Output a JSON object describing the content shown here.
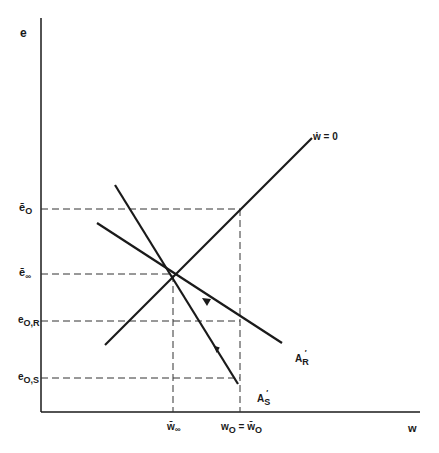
{
  "diagram": {
    "axes": {
      "y_label": "e",
      "x_label": "w"
    },
    "y_ticks": [
      {
        "id": "e_bar_0",
        "base": "ē",
        "sub": "O",
        "y": 209
      },
      {
        "id": "e_bar_inf",
        "base": "ē",
        "sub": "∞",
        "y": 274
      },
      {
        "id": "e_0R",
        "base": "e",
        "sub": "O,R",
        "y": 321
      },
      {
        "id": "e_0S",
        "base": "e",
        "sub": "O,S",
        "y": 378
      }
    ],
    "x_ticks": [
      {
        "id": "w_bar_inf",
        "text": "w̄",
        "sub": "∞",
        "x": 173
      },
      {
        "id": "w_0",
        "text_left": "w",
        "sub_left": "O",
        "eq": " = ",
        "text_right": "w̄",
        "sub_right": "O",
        "x": 240
      }
    ],
    "curves": {
      "wdot_zero": {
        "label": "ẇ = 0"
      },
      "A_R": {
        "label_base": "A",
        "label_sub": "R",
        "prime": "′"
      },
      "A_S": {
        "label_base": "A",
        "label_sub": "S",
        "prime": "′"
      }
    },
    "colors": {
      "line": "#1a1a1a",
      "dashed": "#333333",
      "background": "#ffffff"
    }
  }
}
